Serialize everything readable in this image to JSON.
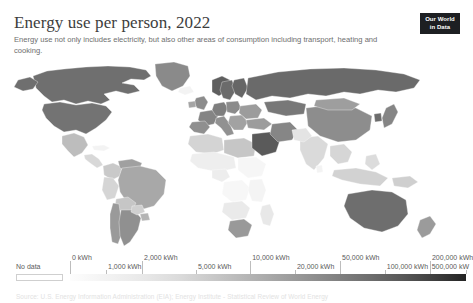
{
  "header": {
    "title": "Energy use per person, 2022",
    "subtitle": "Energy use not only includes electricity, but also other areas of consumption including transport, heating and cooking."
  },
  "logo": {
    "line1": "Our World",
    "line2": "in Data"
  },
  "legend": {
    "no_data_label": "No data",
    "ticks": [
      {
        "label": "0 kWh",
        "row": "upper",
        "pos_pct": 0
      },
      {
        "label": "1,000 kWh",
        "row": "lower",
        "pos_pct": 9.1
      },
      {
        "label": "2,000 kWh",
        "row": "upper",
        "pos_pct": 18.2
      },
      {
        "label": "5,000 kWh",
        "row": "lower",
        "pos_pct": 31.8
      },
      {
        "label": "10,000 kWh",
        "row": "upper",
        "pos_pct": 45.5
      },
      {
        "label": "20,000 kWh",
        "row": "lower",
        "pos_pct": 56.8
      },
      {
        "label": "50,000 kWh",
        "row": "upper",
        "pos_pct": 68.2
      },
      {
        "label": "100,000 kWh",
        "row": "lower",
        "pos_pct": 79.5
      },
      {
        "label": "200,000 kWh",
        "row": "upper",
        "pos_pct": 90.9
      },
      {
        "label": "500,000 kW",
        "row": "lower",
        "pos_pct": 100
      }
    ]
  },
  "footer": {
    "text": "Source: U.S. Energy Information Administration (EIA); Energy Institute - Statistical Review of World Energy"
  },
  "chart_data": {
    "type": "choropleth",
    "title": "Energy use per person, 2022",
    "subtitle": "Energy use not only includes electricity, but also other areas of consumption including transport, heating and cooking.",
    "unit": "kWh",
    "year": 2022,
    "projection": "world-equirectangular",
    "color_scheme": "grayscale-sequential",
    "scale_type": "log",
    "legend_position": "bottom",
    "no_data_color": "#f3f3f3",
    "bins": [
      0,
      1000,
      2000,
      5000,
      10000,
      20000,
      50000,
      100000,
      200000,
      500000
    ],
    "bin_colors": [
      "#fdfdfd",
      "#f2f2f2",
      "#e3e3e3",
      "#cccccc",
      "#b2b2b2",
      "#949494",
      "#787878",
      "#5c5c5c",
      "#3b3b3b",
      "#1f1f1f"
    ],
    "values": [
      {
        "region": "Canada",
        "value": 104000,
        "color": "#6f6f6f"
      },
      {
        "region": "United States",
        "value": 78000,
        "color": "#737373"
      },
      {
        "region": "Greenland",
        "value": 60000,
        "color": "#8a8a8a"
      },
      {
        "region": "Mexico",
        "value": 18000,
        "color": "#bdbdbd"
      },
      {
        "region": "Brazil",
        "value": 17000,
        "color": "#a8a8a8"
      },
      {
        "region": "Argentina",
        "value": 22000,
        "color": "#909090"
      },
      {
        "region": "Chile",
        "value": 21000,
        "color": "#9a9a9a"
      },
      {
        "region": "Colombia",
        "value": 9000,
        "color": "#c9c9c9"
      },
      {
        "region": "Peru",
        "value": 7000,
        "color": "#d5d5d5"
      },
      {
        "region": "Venezuela",
        "value": 16000,
        "color": "#a0a0a0"
      },
      {
        "region": "United Kingdom",
        "value": 32000,
        "color": "#8c8c8c"
      },
      {
        "region": "France",
        "value": 38000,
        "color": "#848484"
      },
      {
        "region": "Germany",
        "value": 41000,
        "color": "#7e7e7e"
      },
      {
        "region": "Norway",
        "value": 78000,
        "color": "#5f5f5f"
      },
      {
        "region": "Sweden",
        "value": 62000,
        "color": "#6b6b6b"
      },
      {
        "region": "Finland",
        "value": 68000,
        "color": "#666666"
      },
      {
        "region": "Spain",
        "value": 31000,
        "color": "#8f8f8f"
      },
      {
        "region": "Italy",
        "value": 30000,
        "color": "#919191"
      },
      {
        "region": "Poland",
        "value": 32000,
        "color": "#8b8b8b"
      },
      {
        "region": "Russia",
        "value": 62000,
        "color": "#6a6a6a"
      },
      {
        "region": "Kazakhstan",
        "value": 48000,
        "color": "#787878"
      },
      {
        "region": "China",
        "value": 31000,
        "color": "#8d8d8d"
      },
      {
        "region": "Japan",
        "value": 38000,
        "color": "#858585"
      },
      {
        "region": "South Korea",
        "value": 62000,
        "color": "#6c6c6c"
      },
      {
        "region": "India",
        "value": 7000,
        "color": "#dadada"
      },
      {
        "region": "Pakistan",
        "value": 4000,
        "color": "#e4e4e4"
      },
      {
        "region": "Indonesia",
        "value": 8000,
        "color": "#d2d2d2"
      },
      {
        "region": "Saudi Arabia",
        "value": 95000,
        "color": "#5a5a5a"
      },
      {
        "region": "Iran",
        "value": 38000,
        "color": "#868686"
      },
      {
        "region": "Turkey",
        "value": 22000,
        "color": "#9c9c9c"
      },
      {
        "region": "Egypt",
        "value": 9000,
        "color": "#cacaca"
      },
      {
        "region": "Nigeria",
        "value": 2000,
        "color": "#ededed"
      },
      {
        "region": "South Africa",
        "value": 26000,
        "color": "#999999"
      },
      {
        "region": "Ethiopia",
        "value": 700,
        "color": "#f6f6f6"
      },
      {
        "region": "DR Congo",
        "value": 600,
        "color": "#f7f7f7"
      },
      {
        "region": "Australia",
        "value": 65000,
        "color": "#6e6e6e"
      },
      {
        "region": "New Zealand",
        "value": 45000,
        "color": "#9b9b9b"
      }
    ]
  }
}
